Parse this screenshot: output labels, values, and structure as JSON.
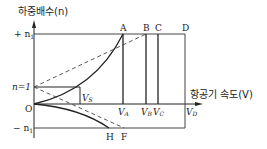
{
  "title": "하중배수(n)",
  "y_axis_label": "하중배수(n)",
  "x_axis_label": "항공기 속도(V)",
  "y_ticks": {
    "pos_n1": "+ n",
    "pos_n1_sub": "1",
    "n_one": "n=1",
    "origin": "O",
    "neg_n1": "− n",
    "neg_n1_sub": "1"
  },
  "top_points": {
    "A": "A",
    "B": "B",
    "C": "C",
    "D": "D"
  },
  "bottom_points": {
    "H": "H",
    "F": "F"
  },
  "velocities": {
    "VS": "V",
    "VS_sub": "S",
    "VA": "V",
    "VA_sub": "A",
    "VB": "V",
    "VB_sub": "B",
    "VC": "V",
    "VC_sub": "C",
    "VD": "V",
    "VD_sub": "D"
  },
  "colors": {
    "line": "#222222",
    "dashed": "#444444",
    "background": "#ffffff"
  }
}
